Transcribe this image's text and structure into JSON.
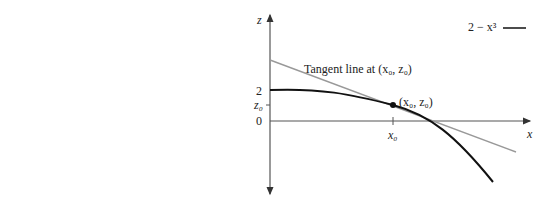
{
  "figure": {
    "legend": {
      "label": "2 − x³"
    },
    "axes": {
      "x_label": "x",
      "z_label": "z"
    },
    "z_ticks": [
      {
        "label": "2"
      },
      {
        "label": "z₀"
      },
      {
        "label": "0"
      }
    ],
    "x_ticks": [
      {
        "label": "x₀"
      }
    ],
    "point_label": "(x₀, z₀)",
    "tangent_label": "Tangent line at (x₀, z₀)",
    "colors": {
      "curve": "#111111",
      "tangent": "#999999",
      "axis": "#555555"
    }
  }
}
